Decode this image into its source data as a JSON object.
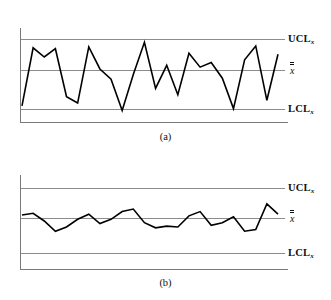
{
  "figure": {
    "panels": [
      {
        "id": "a",
        "caption": "(a)",
        "labels": {
          "ucl": "UCL",
          "ucl_subscript": "x",
          "center": "x",
          "lcl": "LCL",
          "lcl_subscript": "x"
        }
      },
      {
        "id": "b",
        "caption": "(b)",
        "labels": {
          "ucl": "UCL",
          "ucl_subscript": "x",
          "center": "x",
          "lcl": "LCL",
          "lcl_subscript": "x"
        }
      }
    ]
  },
  "colors": {
    "data_line": "#000000",
    "limit_line": "#8c8c8c",
    "center_line": "#8c8c8c",
    "axis": "#7a7a7a",
    "background": "#ffffff",
    "text": "#111111"
  },
  "chart_data": [
    {
      "type": "line",
      "title": "(a)",
      "subtitle": "X-bar control chart with large process variation",
      "xlabel": "",
      "ylabel": "",
      "grid": false,
      "legend": null,
      "axis_ranges": {
        "xlim": [
          0,
          24
        ],
        "ylim": [
          0,
          100
        ]
      },
      "reference_lines": [
        {
          "name": "UCL",
          "label": "UCL",
          "subscript": "x",
          "value": 88
        },
        {
          "name": "CL",
          "label": "x-double-bar",
          "subscript": "",
          "value": 50
        },
        {
          "name": "LCL",
          "label": "LCL",
          "subscript": "x",
          "value": 12
        }
      ],
      "x": [
        0,
        1,
        2,
        3,
        4,
        5,
        6,
        7,
        8,
        9,
        10,
        11,
        12,
        13,
        14,
        15,
        16,
        17,
        18,
        19,
        20,
        21,
        22,
        23
      ],
      "values": [
        16,
        79,
        69,
        78,
        26,
        19,
        80,
        56,
        45,
        11,
        50,
        85,
        35,
        60,
        28,
        73,
        58,
        63,
        46,
        13,
        66,
        81,
        22,
        72
      ],
      "series": [
        {
          "name": "subgroup mean",
          "values": [
            16,
            79,
            69,
            78,
            26,
            19,
            80,
            56,
            45,
            11,
            50,
            85,
            35,
            60,
            28,
            73,
            58,
            63,
            46,
            13,
            66,
            81,
            22,
            72
          ]
        }
      ]
    },
    {
      "type": "line",
      "title": "(b)",
      "subtitle": "X-bar control chart with reduced process variation",
      "xlabel": "",
      "ylabel": "",
      "grid": false,
      "legend": null,
      "axis_ranges": {
        "xlim": [
          0,
          24
        ],
        "ylim": [
          0,
          100
        ]
      },
      "reference_lines": [
        {
          "name": "UCL",
          "label": "UCL",
          "subscript": "x",
          "value": 88
        },
        {
          "name": "CL",
          "label": "x-double-bar",
          "subscript": "",
          "value": 50
        },
        {
          "name": "LCL",
          "label": "LCL",
          "subscript": "x",
          "value": 12
        }
      ],
      "x": [
        0,
        1,
        2,
        3,
        4,
        5,
        6,
        7,
        8,
        9,
        10,
        11,
        12,
        13,
        14,
        15,
        16,
        17,
        18,
        19,
        20,
        21,
        22,
        23
      ],
      "values": [
        57,
        59,
        50,
        38,
        43,
        52,
        58,
        47,
        52,
        61,
        64,
        48,
        42,
        44,
        43,
        56,
        61,
        45,
        48,
        55,
        38,
        40,
        70,
        58
      ],
      "series": [
        {
          "name": "subgroup mean",
          "values": [
            57,
            59,
            50,
            38,
            43,
            52,
            58,
            47,
            52,
            61,
            64,
            48,
            42,
            44,
            43,
            56,
            61,
            45,
            48,
            55,
            38,
            40,
            70,
            58
          ]
        }
      ]
    }
  ]
}
